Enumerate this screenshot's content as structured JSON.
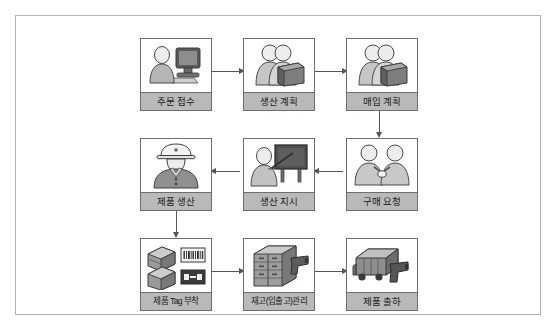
{
  "diagram": {
    "title": "",
    "colors": {
      "frame_border": "#b3b3b3",
      "node_border": "#6e6e6e",
      "label_band": "#b9b9b9",
      "connector": "#555555",
      "icon_dark": "#4a4a4a",
      "icon_mid": "#8c8c8c",
      "icon_light": "#d2d2d2"
    },
    "nodes": [
      {
        "id": "order-receipt",
        "label": "주문 접수",
        "icon": "person-at-computer-icon",
        "row": 1,
        "col": 1
      },
      {
        "id": "production-plan",
        "label": "생산 계획",
        "icon": "two-people-with-box-icon",
        "row": 1,
        "col": 2
      },
      {
        "id": "purchase-plan",
        "label": "매입 계획",
        "icon": "two-people-with-box-icon",
        "row": 1,
        "col": 3
      },
      {
        "id": "product-production",
        "label": "제품 생산",
        "icon": "worker-hardhat-icon",
        "row": 2,
        "col": 1
      },
      {
        "id": "production-order",
        "label": "생산 지시",
        "icon": "person-at-board-icon",
        "row": 2,
        "col": 2
      },
      {
        "id": "purchase-request",
        "label": "구매 요청",
        "icon": "two-people-handshake-icon",
        "row": 2,
        "col": 3
      },
      {
        "id": "product-tagging",
        "label": "제품 Tag 부착",
        "icon": "boxes-with-tags-icon",
        "row": 3,
        "col": 1
      },
      {
        "id": "inventory-mgmt",
        "label": "재고(입출고)관리",
        "icon": "warehouse-scanner-icon",
        "row": 3,
        "col": 2
      },
      {
        "id": "product-shipment",
        "label": "제품 출하",
        "icon": "truck-scanner-icon",
        "row": 3,
        "col": 3
      }
    ],
    "connectors": [
      {
        "id": "order-to-plan",
        "from": "order-receipt",
        "to": "production-plan",
        "direction": "right"
      },
      {
        "id": "plan-to-purchase",
        "from": "production-plan",
        "to": "purchase-plan",
        "direction": "right"
      },
      {
        "id": "purchase-to-request",
        "from": "purchase-plan",
        "to": "purchase-request",
        "direction": "down"
      },
      {
        "id": "request-to-order",
        "from": "purchase-request",
        "to": "production-order",
        "direction": "left"
      },
      {
        "id": "order-to-production",
        "from": "production-order",
        "to": "product-production",
        "direction": "left"
      },
      {
        "id": "production-to-tag",
        "from": "product-production",
        "to": "product-tagging",
        "direction": "down"
      },
      {
        "id": "tag-to-inventory",
        "from": "product-tagging",
        "to": "inventory-mgmt",
        "direction": "right"
      },
      {
        "id": "inventory-to-ship",
        "from": "inventory-mgmt",
        "to": "product-shipment",
        "direction": "right"
      }
    ]
  }
}
